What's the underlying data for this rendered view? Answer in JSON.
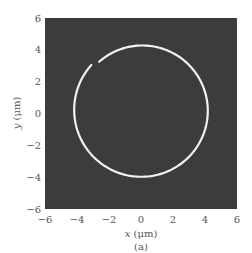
{
  "chart_data": {
    "type": "line",
    "title": "",
    "xlabel": "x (μm)",
    "ylabel": "y (μm)",
    "caption": "(a)",
    "xlim": [
      -6,
      6
    ],
    "ylim": [
      -6,
      6
    ],
    "xticks": [
      -6,
      -4,
      -2,
      0,
      2,
      4,
      6
    ],
    "yticks": [
      -6,
      -4,
      -2,
      0,
      2,
      4,
      6
    ],
    "grid": false,
    "background_color": "#3c3c3c",
    "line_color": "#f2f2ee",
    "series": [
      {
        "name": "trajectory",
        "shape": "near-circular spiral with a small gap at upper-left",
        "center": [
          0.05,
          0.2
        ],
        "radius_start": 4.05,
        "radius_end": 4.25,
        "gap_location_xy": [
          -3.0,
          3.3
        ]
      }
    ]
  },
  "axes": {
    "x_label_var": "x",
    "x_label_unit": " (μm)",
    "y_label_var": "y",
    "y_label_unit": " (μm)",
    "caption": "(a)",
    "x_tick_labels": [
      "−6",
      "−4",
      "−2",
      "0",
      "2",
      "4",
      "6"
    ],
    "y_tick_labels": [
      "−6",
      "−4",
      "−2",
      "0",
      "2",
      "4",
      "6"
    ]
  }
}
